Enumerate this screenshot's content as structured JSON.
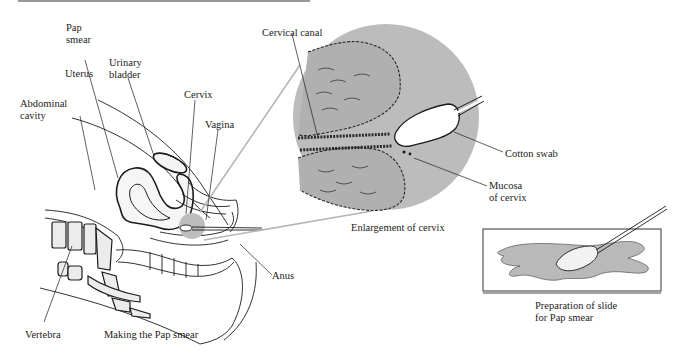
{
  "figure": {
    "panels": [
      {
        "id": "making-pap-smear",
        "caption": "Making the Pap smear",
        "labels": {
          "pap_smear": "Pap\nsmear",
          "uterus": "Uterus",
          "urinary_bladder": "Urinary\nbladder",
          "cervix": "Cervix",
          "abdominal_cavity": "Abdominal\ncavity",
          "vagina": "Vagina",
          "anus": "Anus",
          "vertebra": "Vertebra"
        }
      },
      {
        "id": "enlargement-of-cervix",
        "caption": "Enlargement of cervix",
        "labels": {
          "cervical_canal": "Cervical canal",
          "cotton_swab": "Cotton swab",
          "mucosa_of_cervix": "Mucosa\nof cervix"
        }
      },
      {
        "id": "slide-preparation",
        "caption": "Preparation of slide\nfor Pap smear"
      }
    ]
  },
  "colors": {
    "ink": "#1c1c1c",
    "shade_gray": "#b8b8b8",
    "background": "#ffffff"
  }
}
